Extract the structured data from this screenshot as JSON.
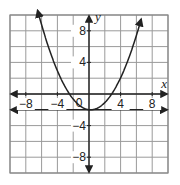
{
  "chart_data": {
    "type": "line",
    "title": "",
    "xlabel": "x",
    "ylabel": "y",
    "xlim": [
      -10,
      10
    ],
    "ylim": [
      -10,
      10
    ],
    "grid": true,
    "grid_step": 2,
    "x_tick_labels": [
      "-8",
      "-4",
      "4",
      "8"
    ],
    "y_tick_labels": [
      "8",
      "4",
      "-4",
      "-8"
    ],
    "origin_label": "0",
    "series": [
      {
        "name": "parabola",
        "equation_estimate": "y = 0.28(x - 0.2)^2 - 2",
        "vertex": [
          0.2,
          -2
        ],
        "x": [
          -6.5,
          -6,
          -4,
          -2,
          0,
          0.2,
          2,
          4,
          6,
          6.6
        ],
        "y": [
          9.9,
          8.3,
          2.9,
          -0.6,
          -2.0,
          -2.0,
          -1.1,
          2.0,
          6.2,
          9.9
        ]
      },
      {
        "name": "horizontal line",
        "equation_estimate": "y = -2",
        "x": [
          -10,
          10
        ],
        "y": [
          -2,
          -2
        ]
      }
    ]
  },
  "colors": {
    "grid": "#9a9a9a",
    "axis": "#222222",
    "curve": "#222222",
    "border": "#888888"
  }
}
